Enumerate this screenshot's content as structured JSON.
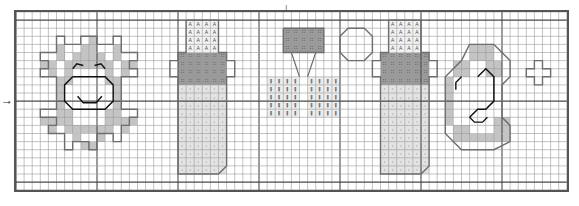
{
  "chart_data": {
    "type": "heatmap",
    "title": "",
    "subtitle": "",
    "xlabel": "",
    "ylabel": "",
    "grid": {
      "columns": 68,
      "rows": 22,
      "cell_px": 8.1,
      "heavy_line_every": 10,
      "grid_on": true,
      "grid_color": "#9a9a9a",
      "heavy_color": "#4a4a4a",
      "border_color": "#555555"
    },
    "center_markers": {
      "top_arrow_column": 34,
      "left_arrow_row": 11,
      "top_glyph": "↓",
      "left_glyph": "→"
    },
    "palette": [
      {
        "key": "white",
        "hex": "#ffffff",
        "symbol": "",
        "name": "blank"
      },
      {
        "key": "light",
        "hex": "#e3e3e3",
        "symbol": ".",
        "name": "light-fill"
      },
      {
        "key": "medium",
        "hex": "#c4c4c4",
        "symbol": "",
        "name": "medium-fill"
      },
      {
        "key": "dark",
        "hex": "#9a9a9a",
        "symbol": "p",
        "name": "dark-fill"
      },
      {
        "key": "symA",
        "hex": "#f2f2f2",
        "symbol": "A",
        "name": "symbol-A"
      },
      {
        "key": "bars",
        "hex": "#ededed",
        "symbol": "|",
        "name": "symbol-bars"
      },
      {
        "key": "outline",
        "hex": "#6e6e6e",
        "symbol": "",
        "name": "motif-outline"
      },
      {
        "key": "stitch",
        "hex": "#111111",
        "symbol": "",
        "name": "backstitch"
      }
    ],
    "motifs": [
      {
        "name": "sun-with-face",
        "label": "Sun",
        "col": 3,
        "row": 2
      },
      {
        "name": "baby-bottle-1",
        "label": "Bottle",
        "col": 21,
        "row": 1
      },
      {
        "name": "rattle",
        "label": "Rattle",
        "col": 31,
        "row": 1
      },
      {
        "name": "baby-bottle-2",
        "label": "Bottle",
        "col": 43,
        "row": 1
      },
      {
        "name": "crescent-moon",
        "label": "Moon",
        "col": 54,
        "row": 4
      },
      {
        "name": "small-star",
        "label": "Star",
        "col": 63,
        "row": 6
      }
    ],
    "blocks": [
      {
        "c": 9,
        "r": 3,
        "w": 1,
        "h": 1,
        "k": "medium"
      },
      {
        "c": 5,
        "r": 4,
        "w": 1,
        "h": 1,
        "k": "medium"
      },
      {
        "c": 8,
        "r": 4,
        "w": 2,
        "h": 1,
        "k": "medium"
      },
      {
        "c": 12,
        "r": 4,
        "w": 1,
        "h": 1,
        "k": "medium"
      },
      {
        "c": 5,
        "r": 5,
        "w": 1,
        "h": 1,
        "k": "medium"
      },
      {
        "c": 7,
        "r": 5,
        "w": 4,
        "h": 1,
        "k": "medium"
      },
      {
        "c": 12,
        "r": 5,
        "w": 1,
        "h": 1,
        "k": "medium"
      },
      {
        "c": 3,
        "r": 6,
        "w": 2,
        "h": 1,
        "k": "medium"
      },
      {
        "c": 6,
        "r": 6,
        "w": 6,
        "h": 1,
        "k": "medium"
      },
      {
        "c": 13,
        "r": 6,
        "w": 2,
        "h": 1,
        "k": "medium"
      },
      {
        "c": 4,
        "r": 7,
        "w": 1,
        "h": 1,
        "k": "medium"
      },
      {
        "c": 6,
        "r": 7,
        "w": 1,
        "h": 1,
        "k": "medium"
      },
      {
        "c": 11,
        "r": 7,
        "w": 1,
        "h": 1,
        "k": "medium"
      },
      {
        "c": 13,
        "r": 7,
        "w": 1,
        "h": 1,
        "k": "medium"
      },
      {
        "c": 5,
        "r": 8,
        "w": 2,
        "h": 1,
        "k": "medium"
      },
      {
        "c": 11,
        "r": 8,
        "w": 2,
        "h": 1,
        "k": "medium"
      },
      {
        "c": 5,
        "r": 9,
        "w": 1,
        "h": 1,
        "k": "medium"
      },
      {
        "c": 12,
        "r": 9,
        "w": 1,
        "h": 1,
        "k": "medium"
      },
      {
        "c": 5,
        "r": 10,
        "w": 1,
        "h": 1,
        "k": "medium"
      },
      {
        "c": 12,
        "r": 10,
        "w": 1,
        "h": 1,
        "k": "medium"
      },
      {
        "c": 5,
        "r": 11,
        "w": 1,
        "h": 1,
        "k": "medium"
      },
      {
        "c": 12,
        "r": 11,
        "w": 1,
        "h": 1,
        "k": "medium"
      },
      {
        "c": 5,
        "r": 12,
        "w": 2,
        "h": 1,
        "k": "medium"
      },
      {
        "c": 11,
        "r": 12,
        "w": 2,
        "h": 1,
        "k": "medium"
      },
      {
        "c": 3,
        "r": 13,
        "w": 3,
        "h": 1,
        "k": "medium"
      },
      {
        "c": 6,
        "r": 13,
        "w": 1,
        "h": 1,
        "k": "medium"
      },
      {
        "c": 11,
        "r": 13,
        "w": 1,
        "h": 1,
        "k": "medium"
      },
      {
        "c": 12,
        "r": 13,
        "w": 3,
        "h": 1,
        "k": "medium"
      },
      {
        "c": 6,
        "r": 14,
        "w": 6,
        "h": 1,
        "k": "medium"
      },
      {
        "c": 4,
        "r": 14,
        "w": 1,
        "h": 1,
        "k": "medium"
      },
      {
        "c": 13,
        "r": 14,
        "w": 1,
        "h": 1,
        "k": "medium"
      },
      {
        "c": 7,
        "r": 15,
        "w": 1,
        "h": 1,
        "k": "medium"
      },
      {
        "c": 10,
        "r": 15,
        "w": 1,
        "h": 1,
        "k": "medium"
      },
      {
        "c": 8,
        "r": 16,
        "w": 2,
        "h": 1,
        "k": "medium"
      },
      {
        "c": 21,
        "r": 1,
        "w": 4,
        "h": 4,
        "k": "symA"
      },
      {
        "c": 20,
        "r": 5,
        "w": 6,
        "h": 4,
        "k": "dark"
      },
      {
        "c": 20,
        "r": 9,
        "w": 6,
        "h": 11,
        "k": "light"
      },
      {
        "c": 33,
        "r": 2,
        "w": 5,
        "h": 3,
        "k": "dark"
      },
      {
        "c": 31,
        "r": 8,
        "w": 4,
        "h": 5,
        "k": "bars"
      },
      {
        "c": 36,
        "r": 8,
        "w": 4,
        "h": 5,
        "k": "bars"
      },
      {
        "c": 46,
        "r": 1,
        "w": 4,
        "h": 4,
        "k": "symA"
      },
      {
        "c": 45,
        "r": 5,
        "w": 6,
        "h": 4,
        "k": "dark"
      },
      {
        "c": 45,
        "r": 9,
        "w": 6,
        "h": 11,
        "k": "light"
      },
      {
        "c": 56,
        "r": 4,
        "w": 3,
        "h": 2,
        "k": "medium"
      },
      {
        "c": 54,
        "r": 6,
        "w": 2,
        "h": 2,
        "k": "medium"
      },
      {
        "c": 58,
        "r": 6,
        "w": 2,
        "h": 2,
        "k": "medium"
      },
      {
        "c": 53,
        "r": 8,
        "w": 1,
        "h": 6,
        "k": "medium"
      },
      {
        "c": 54,
        "r": 14,
        "w": 2,
        "h": 2,
        "k": "medium"
      },
      {
        "c": 56,
        "r": 15,
        "w": 5,
        "h": 1,
        "k": "medium"
      },
      {
        "c": 59,
        "r": 13,
        "w": 2,
        "h": 2,
        "k": "medium"
      }
    ]
  },
  "document": {
    "title": "Cross-stitch pattern chart",
    "type": "pattern-grid"
  }
}
